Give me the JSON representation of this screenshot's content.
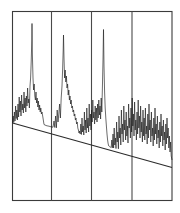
{
  "figure": {
    "title": "",
    "background_color": "#ffffff",
    "trace_color": "#1c1c1c",
    "frame_color": "#3b3b3b",
    "baseline_color": "#2b2b2b"
  },
  "chart_data": {
    "type": "line",
    "title": "",
    "subtitle": "",
    "xlabel": "",
    "ylabel": "",
    "xlim": [
      0,
      180
    ],
    "ylim": [
      0,
      100
    ],
    "grid": false,
    "legend_position": "none",
    "annotations": [],
    "axis_ticks": {
      "x_tick_labels": [],
      "y_tick_labels": []
    },
    "panel_dividers_x": [
      51.5,
      91.5,
      132.0
    ],
    "frame": {
      "left": 12.5,
      "top": 11.5,
      "right": 172.0,
      "bottom": 200.5
    },
    "baseline": {
      "description": "sloping drift baseline",
      "x_start": 12.5,
      "y_start": 123.0,
      "x_end": 172.0,
      "y_end": 167.5
    },
    "major_peaks": [
      {
        "x": 32.0,
        "y_top": 23.5,
        "panel": 1
      },
      {
        "x": 63.5,
        "y_top": 35.0,
        "panel": 2
      },
      {
        "x": 103.5,
        "y_top": 29.5,
        "panel": 3
      }
    ],
    "series": [
      {
        "name": "signal",
        "color": "#1c1c1c",
        "x": [
          12.5,
          13.2,
          13.8,
          14.4,
          15.0,
          15.6,
          16.2,
          16.8,
          17.4,
          18.0,
          18.6,
          19.2,
          19.8,
          20.4,
          21.0,
          21.6,
          22.2,
          22.8,
          23.4,
          24.0,
          24.6,
          25.2,
          25.8,
          26.4,
          27.0,
          27.6,
          28.2,
          28.8,
          29.4,
          30.0,
          30.6,
          31.2,
          31.8,
          32.0,
          32.4,
          33.0,
          33.6,
          34.2,
          34.8,
          35.4,
          36.0,
          36.6,
          37.2,
          37.8,
          38.4,
          39.0,
          39.6,
          40.2,
          40.8,
          41.4,
          42.0,
          43.0,
          44.0,
          45.0,
          46.0,
          47.0,
          48.0,
          49.0,
          50.0,
          51.0,
          52.0,
          53.0,
          54.0,
          54.8,
          55.6,
          56.4,
          57.2,
          58.0,
          58.8,
          59.6,
          60.4,
          61.2,
          62.0,
          62.6,
          63.2,
          63.5,
          64.0,
          64.6,
          65.2,
          65.8,
          66.4,
          67.0,
          67.6,
          68.2,
          68.8,
          69.4,
          70.0,
          70.6,
          71.2,
          71.8,
          72.4,
          73.0,
          73.6,
          74.2,
          74.8,
          75.4,
          76.0,
          76.6,
          77.2,
          77.8,
          78.4,
          79.0,
          79.6,
          80.2,
          80.8,
          81.4,
          82.0,
          82.6,
          83.2,
          83.8,
          84.4,
          85.0,
          85.6,
          86.2,
          86.8,
          87.4,
          88.0,
          88.6,
          89.2,
          89.8,
          90.4,
          91.0,
          91.6,
          92.2,
          92.8,
          93.4,
          94.0,
          94.6,
          95.2,
          95.8,
          96.4,
          97.0,
          97.6,
          98.2,
          98.8,
          99.4,
          100.0,
          100.6,
          101.2,
          101.8,
          102.4,
          103.0,
          103.5,
          104.0,
          104.6,
          105.2,
          105.8,
          106.4,
          107.0,
          107.6,
          108.2,
          108.8,
          109.4,
          110.0,
          110.6,
          111.2,
          111.8,
          112.4,
          113.0,
          113.6,
          114.2,
          114.8,
          115.4,
          116.0,
          116.6,
          117.2,
          117.8,
          118.4,
          119.0,
          119.6,
          120.2,
          120.8,
          121.4,
          122.0,
          122.6,
          123.2,
          123.8,
          124.4,
          125.0,
          125.6,
          126.2,
          126.8,
          127.4,
          128.0,
          128.6,
          129.2,
          129.8,
          130.4,
          131.0,
          131.6,
          132.2,
          132.8,
          133.4,
          134.0,
          134.6,
          135.2,
          135.8,
          136.4,
          137.0,
          137.6,
          138.2,
          138.8,
          139.4,
          140.0,
          140.6,
          141.2,
          141.8,
          142.4,
          143.0,
          143.6,
          144.2,
          144.8,
          145.4,
          146.0,
          146.6,
          147.2,
          147.8,
          148.4,
          149.0,
          149.6,
          150.2,
          150.8,
          151.4,
          152.0,
          152.6,
          153.2,
          153.8,
          154.4,
          155.0,
          155.6,
          156.2,
          156.8,
          157.4,
          158.0,
          158.6,
          159.2,
          159.8,
          160.4,
          161.0,
          161.6,
          162.2,
          162.8,
          163.4,
          164.0,
          164.6,
          165.2,
          165.8,
          166.4,
          167.0,
          167.6,
          168.2,
          168.8,
          169.4,
          170.0,
          170.6,
          171.2,
          172.0
        ],
        "y": [
          123.0,
          116.0,
          122.5,
          112.0,
          121.0,
          106.0,
          118.5,
          110.0,
          120.0,
          104.0,
          117.0,
          97.0,
          112.0,
          101.0,
          116.0,
          95.0,
          110.0,
          104.0,
          113.0,
          92.0,
          108.0,
          98.0,
          112.0,
          96.0,
          106.0,
          88.0,
          103.0,
          99.0,
          108.0,
          86.0,
          78.0,
          62.0,
          40.0,
          23.5,
          55.0,
          78.0,
          90.0,
          84.0,
          96.0,
          100.0,
          92.0,
          103.0,
          98.0,
          107.0,
          101.0,
          110.0,
          105.0,
          112.0,
          108.0,
          114.0,
          112.0,
          118.0,
          124.5,
          125.0,
          125.5,
          125.8,
          126.0,
          126.2,
          126.5,
          126.8,
          127.0,
          127.2,
          121.0,
          127.5,
          116.0,
          127.8,
          110.0,
          122.0,
          114.0,
          104.0,
          118.0,
          98.0,
          86.0,
          70.0,
          50.0,
          35.0,
          58.0,
          78.0,
          70.0,
          82.0,
          76.0,
          88.0,
          84.0,
          95.0,
          90.0,
          100.0,
          96.0,
          104.0,
          100.0,
          108.0,
          106.0,
          112.0,
          110.0,
          116.0,
          114.0,
          120.0,
          118.0,
          124.0,
          122.0,
          128.0,
          130.0,
          133.0,
          131.0,
          134.0,
          124.0,
          134.5,
          118.0,
          132.0,
          126.0,
          135.0,
          112.0,
          130.0,
          120.0,
          133.0,
          108.0,
          128.0,
          118.0,
          132.0,
          104.0,
          126.0,
          114.0,
          130.0,
          110.0,
          122.0,
          100.0,
          118.0,
          112.0,
          124.0,
          106.0,
          120.0,
          108.0,
          122.0,
          104.0,
          118.0,
          100.0,
          115.0,
          106.0,
          119.0,
          98.0,
          112.0,
          88.0,
          60.0,
          29.5,
          66.0,
          92.0,
          108.0,
          118.0,
          126.0,
          134.0,
          140.0,
          144.0,
          146.0,
          146.5,
          147.0,
          147.2,
          147.5,
          140.0,
          147.8,
          134.0,
          148.0,
          128.0,
          145.0,
          138.0,
          148.5,
          122.0,
          142.0,
          132.0,
          148.8,
          116.0,
          138.0,
          128.0,
          145.0,
          110.0,
          134.0,
          124.0,
          142.0,
          106.0,
          130.0,
          120.0,
          140.0,
          112.0,
          136.0,
          126.0,
          143.0,
          104.0,
          128.0,
          118.0,
          138.0,
          108.0,
          132.0,
          98.0,
          126.0,
          114.0,
          136.0,
          102.0,
          130.0,
          120.0,
          140.0,
          112.0,
          134.0,
          100.0,
          128.0,
          116.0,
          138.0,
          106.0,
          132.0,
          122.0,
          142.0,
          110.0,
          136.0,
          118.0,
          140.0,
          108.0,
          134.0,
          126.0,
          144.0,
          114.0,
          138.0,
          104.0,
          130.0,
          120.0,
          142.0,
          112.0,
          136.0,
          128.0,
          146.0,
          118.0,
          140.0,
          108.0,
          134.0,
          124.0,
          144.0,
          116.0,
          138.0,
          130.0,
          148.0,
          122.0,
          142.0,
          114.0,
          136.0,
          126.0,
          146.0,
          120.0,
          140.0,
          132.0,
          150.0,
          124.0,
          144.0,
          118.0,
          138.0,
          128.0,
          148.0,
          136.0,
          152.0,
          142.0,
          156.0,
          160.0
        ]
      }
    ]
  }
}
